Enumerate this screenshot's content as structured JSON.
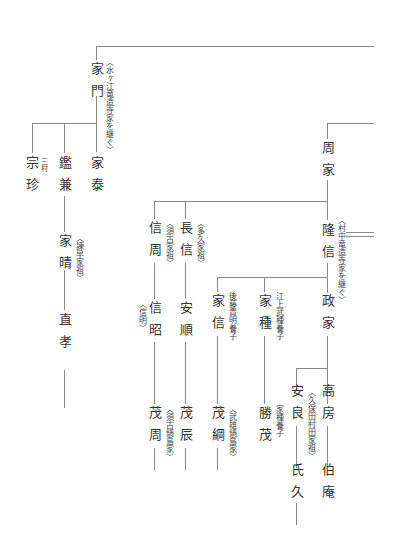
{
  "persons": {
    "iekado": {
      "name": "家門",
      "note": "〈水ヶ江竜造寺家を継ぐ〉"
    },
    "soucin": {
      "name": "宗珍",
      "note": "三村"
    },
    "kanekane": {
      "name": "鑑兼"
    },
    "ieyasu": {
      "name": "家泰"
    },
    "iehare": {
      "name": "家晴",
      "note": "〈諫早家祖〉"
    },
    "naotaka": {
      "name": "直孝"
    },
    "chikaie": {
      "name": "周家"
    },
    "takanobu": {
      "name": "隆信",
      "note": "〈村中竜造寺家を継ぐ〉"
    },
    "nobuchika": {
      "name": "信周",
      "note": "〈須古家祖〉"
    },
    "naganobu": {
      "name": "長信",
      "note": "〈多久家祖〉"
    },
    "nobuaki": {
      "name": "信昭",
      "note": "〈信明〉"
    },
    "yasutoshi": {
      "name": "安順"
    },
    "shigechika": {
      "name": "茂周",
      "note": "〈須古鍋島家〉"
    },
    "shigetoki": {
      "name": "茂辰"
    },
    "ienobu": {
      "name": "家信",
      "note": "後藤貴明養子"
    },
    "shigetsuna": {
      "name": "茂綱",
      "note": "〈武雄鍋島家〉"
    },
    "ietane": {
      "name": "家種",
      "note": "江上武種養子"
    },
    "katsushige": {
      "name": "勝茂",
      "note": "家種養子"
    },
    "masaie": {
      "name": "政家"
    },
    "takafusa": {
      "name": "高房"
    },
    "hakuan": {
      "name": "伯庵"
    },
    "yasuyoshi": {
      "name": "安良",
      "note": "〈久保田村田家祖〉"
    },
    "ujihisa": {
      "name": "氏久"
    }
  }
}
